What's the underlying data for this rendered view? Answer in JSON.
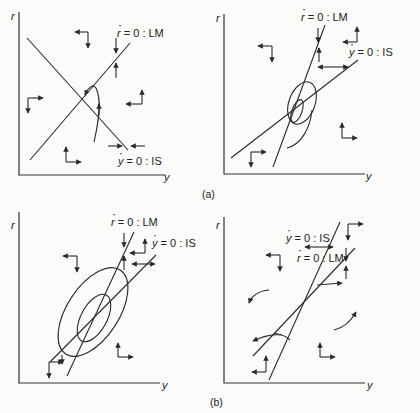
{
  "figure": {
    "panel_labels": {
      "a": "(a)",
      "b": "(b)"
    },
    "panels": [
      {
        "id": "a-left",
        "axis_y": "r",
        "axis_x": "y",
        "lm_label": {
          "var": "r",
          "text": " = 0 : LM"
        },
        "is_label": {
          "var": "y",
          "text": " = 0 : IS"
        },
        "description": "LM upward sloping, IS downward sloping; trajectory spirals into equilibrium"
      },
      {
        "id": "a-right",
        "axis_y": "r",
        "axis_x": "y",
        "lm_label": {
          "var": "r",
          "text": " = 0 : LM"
        },
        "is_label": {
          "var": "y",
          "text": " = 0 : IS"
        },
        "description": "LM steeper than IS, both upward sloping; stable spiral into equilibrium"
      },
      {
        "id": "b-left",
        "axis_y": "r",
        "axis_x": "y",
        "lm_label": {
          "var": "r",
          "text": " = 0 : LM"
        },
        "is_label": {
          "var": "y",
          "text": " = 0 : IS"
        },
        "description": "LM steeper than IS; unstable spiral moving away from equilibrium"
      },
      {
        "id": "b-right",
        "axis_y": "r",
        "axis_x": "y",
        "lm_label": {
          "var": "r",
          "text": " = 0 : LM"
        },
        "is_label": {
          "var": "y",
          "text": " = 0 : IS"
        },
        "description": "IS steeper than LM; saddle-path dynamics"
      }
    ]
  },
  "colors": {
    "ink": "#2a2a2a",
    "background": "#fbfbf9"
  }
}
